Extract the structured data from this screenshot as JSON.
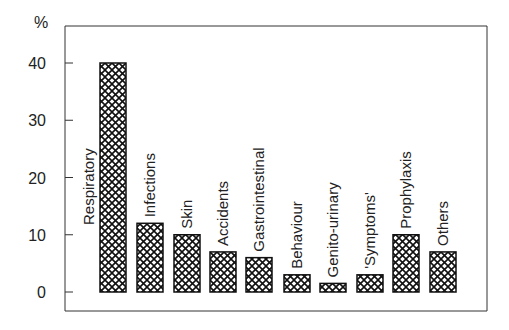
{
  "chart_data": {
    "type": "bar",
    "title": "",
    "xlabel": "",
    "ylabel": "%",
    "ylim": [
      0,
      40
    ],
    "yticks": [
      0,
      10,
      20,
      30,
      40
    ],
    "grid": false,
    "legend": null,
    "categories": [
      "Respiratory",
      "Infections",
      "Skin",
      "Accidents",
      "Gastrointestinal",
      "Behaviour",
      "Genito-urinary",
      "'Symptoms'",
      "Prophylaxis",
      "Others"
    ],
    "values": [
      40,
      12,
      10,
      7,
      6,
      3,
      1.5,
      3,
      10,
      7
    ],
    "bar_fill": "crosshatch",
    "colors": {
      "bar_fill": "#ffffff",
      "hatch": "#111111",
      "axis": "#333333"
    }
  }
}
